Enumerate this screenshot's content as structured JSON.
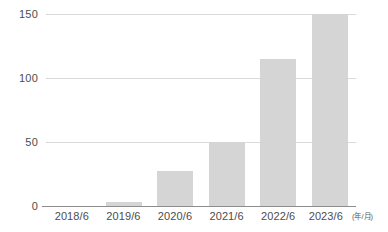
{
  "chart_data": {
    "type": "bar",
    "title": "",
    "xlabel": "",
    "ylabel": "",
    "xunit": "(年/月)",
    "categories": [
      "2018/6",
      "2019/6",
      "2020/6",
      "2021/6",
      "2022/6",
      "2023/6"
    ],
    "values": [
      0,
      3,
      27,
      50,
      115,
      150
    ],
    "ylim": [
      0,
      150
    ],
    "yticks": [
      "0",
      "50",
      "100",
      "150"
    ],
    "ytick_values": [
      0,
      50,
      100,
      150
    ],
    "grid": true,
    "legend": false,
    "legend_position": "none",
    "series": [
      {
        "name": "",
        "values": [
          0,
          3,
          27,
          50,
          115,
          150
        ]
      }
    ],
    "colors": {
      "bar_fill": "#d5d5d5",
      "gridline": "#d9d9d9",
      "axis_line": "#8d8d8d",
      "tick_label": "#4d4d4d",
      "background": "#ffffff"
    }
  },
  "axis": {
    "y": {
      "t150": "150",
      "t100": "100",
      "t50": "50",
      "t0": "0"
    }
  },
  "header": {
    "clipped_title": ""
  }
}
